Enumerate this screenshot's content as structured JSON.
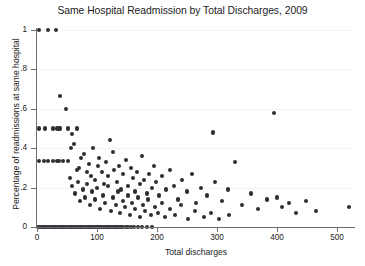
{
  "chart_data": {
    "type": "scatter",
    "title": "Same Hospital Readmission by Total Discharges, 2009",
    "xlabel": "Total discharges",
    "ylabel": "Percentage of readmissions at same hospital",
    "xlim": [
      0,
      530
    ],
    "ylim": [
      0,
      1
    ],
    "xticks": [
      0,
      100,
      200,
      300,
      400,
      500
    ],
    "xticklabels": [
      "0",
      "100",
      "200",
      "300",
      "400",
      "500"
    ],
    "yticks": [
      0,
      0.2,
      0.4,
      0.6,
      0.8,
      1
    ],
    "yticklabels": [
      "0",
      ".2",
      ".4",
      ".6",
      ".8",
      "1"
    ],
    "grid": "horizontal",
    "grid_color": "#f4f4f5",
    "legend": null,
    "marker_color": "#2e2e33",
    "marker_size": 4.2,
    "background": "#ffffff",
    "axis_color": "#6e6e72",
    "series": [
      {
        "name": "Hospitals",
        "points": [
          [
            4,
            1.0
          ],
          [
            18,
            1.0
          ],
          [
            31,
            1.0
          ],
          [
            38,
            0.667
          ],
          [
            3,
            0.5
          ],
          [
            14,
            0.5
          ],
          [
            26,
            0.5
          ],
          [
            33,
            0.5
          ],
          [
            36,
            0.5
          ],
          [
            39,
            0.5
          ],
          [
            48,
            0.6
          ],
          [
            52,
            0.5
          ],
          [
            58,
            0.474
          ],
          [
            66,
            0.5
          ],
          [
            3,
            0.333
          ],
          [
            11,
            0.333
          ],
          [
            19,
            0.333
          ],
          [
            27,
            0.333
          ],
          [
            33,
            0.333
          ],
          [
            36,
            0.333
          ],
          [
            44,
            0.333
          ],
          [
            51,
            0.333
          ],
          [
            57,
            0.4
          ],
          [
            61,
            0.42
          ],
          [
            66,
            0.29
          ],
          [
            70,
            0.3
          ],
          [
            74,
            0.35
          ],
          [
            78,
            0.37
          ],
          [
            83,
            0.28
          ],
          [
            86,
            0.32
          ],
          [
            90,
            0.26
          ],
          [
            94,
            0.4
          ],
          [
            97,
            0.24
          ],
          [
            101,
            0.31
          ],
          [
            104,
            0.35
          ],
          [
            108,
            0.28
          ],
          [
            112,
            0.22
          ],
          [
            115,
            0.33
          ],
          [
            119,
            0.26
          ],
          [
            122,
            0.44
          ],
          [
            126,
            0.38
          ],
          [
            129,
            0.29
          ],
          [
            133,
            0.23
          ],
          [
            137,
            0.31
          ],
          [
            140,
            0.19
          ],
          [
            144,
            0.27
          ],
          [
            148,
            0.34
          ],
          [
            152,
            0.21
          ],
          [
            156,
            0.3
          ],
          [
            160,
            0.25
          ],
          [
            163,
            0.18
          ],
          [
            167,
            0.28
          ],
          [
            171,
            0.22
          ],
          [
            175,
            0.36
          ],
          [
            179,
            0.24
          ],
          [
            183,
            0.17
          ],
          [
            187,
            0.27
          ],
          [
            191,
            0.2
          ],
          [
            195,
            0.31
          ],
          [
            199,
            0.23
          ],
          [
            204,
            0.16
          ],
          [
            209,
            0.26
          ],
          [
            215,
            0.19
          ],
          [
            221,
            0.29
          ],
          [
            228,
            0.21
          ],
          [
            235,
            0.14
          ],
          [
            242,
            0.24
          ],
          [
            250,
            0.18
          ],
          [
            258,
            0.27
          ],
          [
            265,
            0.12
          ],
          [
            274,
            0.2
          ],
          [
            283,
            0.16
          ],
          [
            293,
            0.48
          ],
          [
            297,
            0.23
          ],
          [
            308,
            0.13
          ],
          [
            318,
            0.19
          ],
          [
            330,
            0.33
          ],
          [
            342,
            0.11
          ],
          [
            356,
            0.17
          ],
          [
            368,
            0.09
          ],
          [
            383,
            0.14
          ],
          [
            395,
            0.58
          ],
          [
            400,
            0.15
          ],
          [
            408,
            0.1
          ],
          [
            420,
            0.12
          ],
          [
            432,
            0.07
          ],
          [
            448,
            0.13
          ],
          [
            465,
            0.08
          ],
          [
            520,
            0.1
          ],
          [
            55,
            0.25
          ],
          [
            59,
            0.21
          ],
          [
            63,
            0.17
          ],
          [
            68,
            0.23
          ],
          [
            72,
            0.13
          ],
          [
            76,
            0.19
          ],
          [
            80,
            0.15
          ],
          [
            84,
            0.22
          ],
          [
            88,
            0.11
          ],
          [
            92,
            0.18
          ],
          [
            96,
            0.14
          ],
          [
            100,
            0.2
          ],
          [
            105,
            0.09
          ],
          [
            110,
            0.16
          ],
          [
            114,
            0.12
          ],
          [
            118,
            0.21
          ],
          [
            123,
            0.08
          ],
          [
            127,
            0.15
          ],
          [
            131,
            0.11
          ],
          [
            135,
            0.18
          ],
          [
            139,
            0.07
          ],
          [
            143,
            0.13
          ],
          [
            147,
            0.1
          ],
          [
            151,
            0.16
          ],
          [
            155,
            0.06
          ],
          [
            159,
            0.12
          ],
          [
            164,
            0.09
          ],
          [
            168,
            0.15
          ],
          [
            172,
            0.05
          ],
          [
            176,
            0.11
          ],
          [
            180,
            0.08
          ],
          [
            185,
            0.14
          ],
          [
            190,
            0.06
          ],
          [
            196,
            0.1
          ],
          [
            202,
            0.07
          ],
          [
            208,
            0.12
          ],
          [
            214,
            0.05
          ],
          [
            222,
            0.09
          ],
          [
            230,
            0.06
          ],
          [
            240,
            0.11
          ],
          [
            252,
            0.04
          ],
          [
            264,
            0.08
          ],
          [
            278,
            0.05
          ],
          [
            290,
            0.07
          ],
          [
            304,
            0.04
          ],
          [
            320,
            0.06
          ],
          [
            2,
            0.0
          ],
          [
            5,
            0.0
          ],
          [
            8,
            0.0
          ],
          [
            11,
            0.0
          ],
          [
            14,
            0.0
          ],
          [
            17,
            0.0
          ],
          [
            20,
            0.0
          ],
          [
            23,
            0.0
          ],
          [
            26,
            0.0
          ],
          [
            29,
            0.0
          ],
          [
            32,
            0.0
          ],
          [
            35,
            0.0
          ],
          [
            38,
            0.0
          ],
          [
            41,
            0.0
          ],
          [
            44,
            0.0
          ],
          [
            47,
            0.0
          ],
          [
            50,
            0.0
          ],
          [
            53,
            0.0
          ],
          [
            56,
            0.0
          ],
          [
            59,
            0.0
          ],
          [
            62,
            0.0
          ],
          [
            65,
            0.0
          ],
          [
            68,
            0.0
          ],
          [
            71,
            0.0
          ],
          [
            74,
            0.0
          ],
          [
            77,
            0.0
          ],
          [
            80,
            0.0
          ],
          [
            83,
            0.0
          ],
          [
            86,
            0.0
          ],
          [
            89,
            0.0
          ],
          [
            92,
            0.0
          ],
          [
            95,
            0.0
          ],
          [
            98,
            0.0
          ],
          [
            101,
            0.0
          ],
          [
            104,
            0.0
          ],
          [
            107,
            0.0
          ],
          [
            110,
            0.0
          ],
          [
            113,
            0.0
          ],
          [
            116,
            0.0
          ],
          [
            119,
            0.0
          ],
          [
            122,
            0.0
          ],
          [
            125,
            0.0
          ],
          [
            128,
            0.0
          ],
          [
            131,
            0.0
          ],
          [
            134,
            0.0
          ],
          [
            137,
            0.0
          ],
          [
            140,
            0.0
          ],
          [
            144,
            0.0
          ],
          [
            148,
            0.0
          ],
          [
            152,
            0.0
          ],
          [
            157,
            0.0
          ],
          [
            162,
            0.0
          ],
          [
            168,
            0.0
          ],
          [
            175,
            0.0
          ],
          [
            183,
            0.0
          ],
          [
            192,
            0.0
          ]
        ]
      }
    ]
  }
}
